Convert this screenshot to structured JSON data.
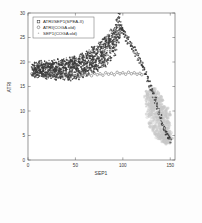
{
  "figure": {
    "background": "#fdfdfd",
    "axes_color": "#555555"
  },
  "chart_data": {
    "type": "scatter",
    "title": "",
    "xlabel": "SEP1",
    "ylabel": "ATRI",
    "xlim": [
      0,
      155
    ],
    "ylim": [
      0,
      30
    ],
    "xticks": [
      0,
      50,
      100,
      150
    ],
    "xtick_labels": [
      "0",
      "50",
      "100",
      "150"
    ],
    "yticks": [
      0,
      5,
      10,
      15,
      20,
      25,
      30
    ],
    "ytick_labels": [
      "0",
      "5",
      "10",
      "15",
      "20",
      "25",
      "30"
    ],
    "grid": false,
    "legend_position": "upper-left",
    "legend": [
      {
        "label": "ATRI/SEP1(SPEA-II)",
        "marker": "square",
        "color": "#3a3a3a"
      },
      {
        "label": "ATRI(COGA old)",
        "marker": "circle",
        "color": "#5a5a5a"
      },
      {
        "label": "SEP1(COGA old)",
        "marker": "dot",
        "color": "#b8b8b8"
      }
    ],
    "series": [
      {
        "name": "ATRI/SEP1(SPEA-II)",
        "marker": "square",
        "color": "#3a3a3a",
        "description": "Dense dark Pareto-front cloud: plateau near ATRI 18-20 for SEP1 5-70, rising to a sharp peak ATRI 28 at SEP1 95, then a steep descending arc to ATRI 4 at SEP1 150.",
        "points": [
          [
            5,
            18.3
          ],
          [
            6,
            18.6
          ],
          [
            7,
            18.1
          ],
          [
            8,
            18.8
          ],
          [
            9,
            18.4
          ],
          [
            10,
            18.0
          ],
          [
            11,
            18.7
          ],
          [
            12,
            18.2
          ],
          [
            13,
            18.9
          ],
          [
            14,
            18.3
          ],
          [
            15,
            18.5
          ],
          [
            16,
            18.1
          ],
          [
            17,
            18.8
          ],
          [
            18,
            18.4
          ],
          [
            19,
            18.0
          ],
          [
            20,
            18.6
          ],
          [
            21,
            18.2
          ],
          [
            22,
            18.9
          ],
          [
            23,
            18.5
          ],
          [
            24,
            18.1
          ],
          [
            25,
            18.7
          ],
          [
            26,
            18.3
          ],
          [
            27,
            18.8
          ],
          [
            28,
            18.4
          ],
          [
            29,
            18.0
          ],
          [
            30,
            18.6
          ],
          [
            31,
            18.2
          ],
          [
            32,
            18.9
          ],
          [
            33,
            18.5
          ],
          [
            34,
            18.1
          ],
          [
            35,
            18.7
          ],
          [
            36,
            18.3
          ],
          [
            37,
            18.8
          ],
          [
            38,
            18.4
          ],
          [
            39,
            18.2
          ],
          [
            40,
            18.9
          ],
          [
            41,
            18.5
          ],
          [
            42,
            18.7
          ],
          [
            43,
            18.3
          ],
          [
            44,
            19.0
          ],
          [
            45,
            18.6
          ],
          [
            46,
            18.2
          ],
          [
            47,
            18.9
          ],
          [
            48,
            18.5
          ],
          [
            49,
            19.1
          ],
          [
            50,
            18.7
          ],
          [
            51,
            18.3
          ],
          [
            52,
            19.0
          ],
          [
            53,
            18.6
          ],
          [
            54,
            19.2
          ],
          [
            55,
            18.8
          ],
          [
            56,
            19.4
          ],
          [
            57,
            19.0
          ],
          [
            58,
            19.6
          ],
          [
            59,
            19.2
          ],
          [
            60,
            19.8
          ],
          [
            61,
            19.4
          ],
          [
            62,
            20.0
          ],
          [
            63,
            19.6
          ],
          [
            64,
            20.2
          ],
          [
            65,
            19.8
          ],
          [
            66,
            20.4
          ],
          [
            67,
            20.0
          ],
          [
            68,
            20.6
          ],
          [
            69,
            20.2
          ],
          [
            70,
            20.8
          ],
          [
            71,
            20.4
          ],
          [
            72,
            21.0
          ],
          [
            73,
            20.6
          ],
          [
            74,
            21.3
          ],
          [
            75,
            21.0
          ],
          [
            76,
            21.6
          ],
          [
            77,
            21.2
          ],
          [
            78,
            21.9
          ],
          [
            79,
            21.5
          ],
          [
            80,
            22.2
          ],
          [
            81,
            21.8
          ],
          [
            82,
            22.6
          ],
          [
            83,
            22.2
          ],
          [
            84,
            23.0
          ],
          [
            85,
            22.6
          ],
          [
            86,
            23.5
          ],
          [
            87,
            23.1
          ],
          [
            88,
            24.0
          ],
          [
            89,
            23.6
          ],
          [
            90,
            24.6
          ],
          [
            91,
            24.2
          ],
          [
            92,
            25.3
          ],
          [
            93,
            25.0
          ],
          [
            94,
            26.2
          ],
          [
            95,
            27.0
          ],
          [
            96,
            27.9
          ],
          [
            97,
            27.4
          ],
          [
            98,
            27.0
          ],
          [
            99,
            26.6
          ],
          [
            100,
            26.2
          ],
          [
            102,
            25.6
          ],
          [
            104,
            25.0
          ],
          [
            106,
            24.4
          ],
          [
            108,
            23.8
          ],
          [
            110,
            23.2
          ],
          [
            112,
            22.5
          ],
          [
            114,
            21.8
          ],
          [
            116,
            21.0
          ],
          [
            118,
            20.2
          ],
          [
            120,
            19.4
          ],
          [
            122,
            18.5
          ],
          [
            124,
            17.6
          ],
          [
            126,
            16.6
          ],
          [
            128,
            15.6
          ],
          [
            130,
            14.5
          ],
          [
            132,
            13.4
          ],
          [
            134,
            12.2
          ],
          [
            136,
            11.0
          ],
          [
            138,
            9.8
          ],
          [
            140,
            8.6
          ],
          [
            142,
            7.4
          ],
          [
            144,
            6.3
          ],
          [
            146,
            5.4
          ],
          [
            148,
            4.6
          ],
          [
            150,
            4.0
          ]
        ]
      },
      {
        "name": "ATRI(COGA old)",
        "marker": "circle",
        "color": "#5a5a5a",
        "description": "Open circles strung along the lower edge of the plateau near ATRI 17, from SEP1 4 to SEP1 120.",
        "points": [
          [
            4,
            17.6
          ],
          [
            7,
            17.2
          ],
          [
            10,
            17.0
          ],
          [
            13,
            17.4
          ],
          [
            16,
            17.1
          ],
          [
            19,
            16.9
          ],
          [
            22,
            17.3
          ],
          [
            25,
            17.0
          ],
          [
            28,
            17.2
          ],
          [
            31,
            16.9
          ],
          [
            34,
            17.4
          ],
          [
            37,
            17.1
          ],
          [
            40,
            17.3
          ],
          [
            43,
            17.0
          ],
          [
            46,
            17.5
          ],
          [
            49,
            17.2
          ],
          [
            52,
            17.4
          ],
          [
            55,
            17.1
          ],
          [
            58,
            17.6
          ],
          [
            61,
            17.3
          ],
          [
            64,
            17.5
          ],
          [
            67,
            17.2
          ],
          [
            70,
            17.7
          ],
          [
            73,
            17.4
          ],
          [
            76,
            17.6
          ],
          [
            79,
            17.3
          ],
          [
            82,
            17.8
          ],
          [
            85,
            17.5
          ],
          [
            88,
            17.7
          ],
          [
            91,
            17.4
          ],
          [
            94,
            17.9
          ],
          [
            97,
            17.6
          ],
          [
            100,
            17.8
          ],
          [
            103,
            17.5
          ],
          [
            106,
            17.9
          ],
          [
            109,
            17.6
          ],
          [
            112,
            17.8
          ],
          [
            115,
            17.5
          ],
          [
            118,
            17.7
          ],
          [
            120,
            17.4
          ]
        ]
      },
      {
        "name": "SEP1(COGA old)",
        "marker": "dot",
        "color": "#c8c8c8",
        "description": "Light gray diffuse blob cluster occupying SEP1 124-150, ATRI 3.5-14.5, densest near SEP1 138, ATRI 8.",
        "points": [
          [
            126,
            13.8
          ],
          [
            128,
            13.2
          ],
          [
            130,
            12.5
          ],
          [
            131,
            14.0
          ],
          [
            132,
            11.8
          ],
          [
            133,
            13.4
          ],
          [
            134,
            12.0
          ],
          [
            135,
            10.8
          ],
          [
            136,
            12.6
          ],
          [
            137,
            11.2
          ],
          [
            138,
            9.8
          ],
          [
            139,
            11.8
          ],
          [
            140,
            10.4
          ],
          [
            141,
            9.0
          ],
          [
            142,
            11.0
          ],
          [
            143,
            9.6
          ],
          [
            144,
            8.2
          ],
          [
            145,
            10.2
          ],
          [
            146,
            8.8
          ],
          [
            147,
            7.4
          ],
          [
            148,
            9.4
          ],
          [
            127,
            12.2
          ],
          [
            129,
            11.4
          ],
          [
            131,
            10.6
          ],
          [
            133,
            9.8
          ],
          [
            135,
            9.0
          ],
          [
            137,
            8.2
          ],
          [
            139,
            7.4
          ],
          [
            141,
            6.6
          ],
          [
            143,
            5.8
          ],
          [
            145,
            5.0
          ],
          [
            147,
            4.4
          ],
          [
            149,
            4.0
          ],
          [
            126,
            11.0
          ],
          [
            128,
            10.2
          ],
          [
            130,
            9.4
          ],
          [
            132,
            8.6
          ],
          [
            134,
            7.8
          ],
          [
            136,
            7.0
          ],
          [
            138,
            6.2
          ],
          [
            140,
            5.4
          ],
          [
            142,
            4.8
          ],
          [
            144,
            4.2
          ],
          [
            146,
            3.8
          ],
          [
            148,
            3.6
          ],
          [
            125,
            12.8
          ],
          [
            127,
            9.0
          ],
          [
            129,
            7.8
          ],
          [
            131,
            7.0
          ],
          [
            133,
            6.2
          ],
          [
            135,
            5.6
          ],
          [
            137,
            5.0
          ],
          [
            139,
            4.6
          ],
          [
            141,
            4.2
          ],
          [
            143,
            3.9
          ],
          [
            145,
            3.7
          ],
          [
            134,
            14.2
          ],
          [
            136,
            13.6
          ],
          [
            132,
            12.9
          ],
          [
            130,
            14.4
          ],
          [
            138,
            12.8
          ],
          [
            140,
            12.0
          ],
          [
            142,
            10.8
          ],
          [
            144,
            9.8
          ],
          [
            146,
            6.2
          ],
          [
            148,
            5.6
          ],
          [
            150,
            4.2
          ],
          [
            149,
            5.2
          ],
          [
            147,
            6.8
          ],
          [
            145,
            7.8
          ],
          [
            143,
            8.6
          ],
          [
            141,
            8.0
          ],
          [
            139,
            9.2
          ],
          [
            137,
            9.8
          ],
          [
            135,
            11.6
          ],
          [
            133,
            11.0
          ],
          [
            131,
            11.9
          ]
        ]
      }
    ]
  }
}
